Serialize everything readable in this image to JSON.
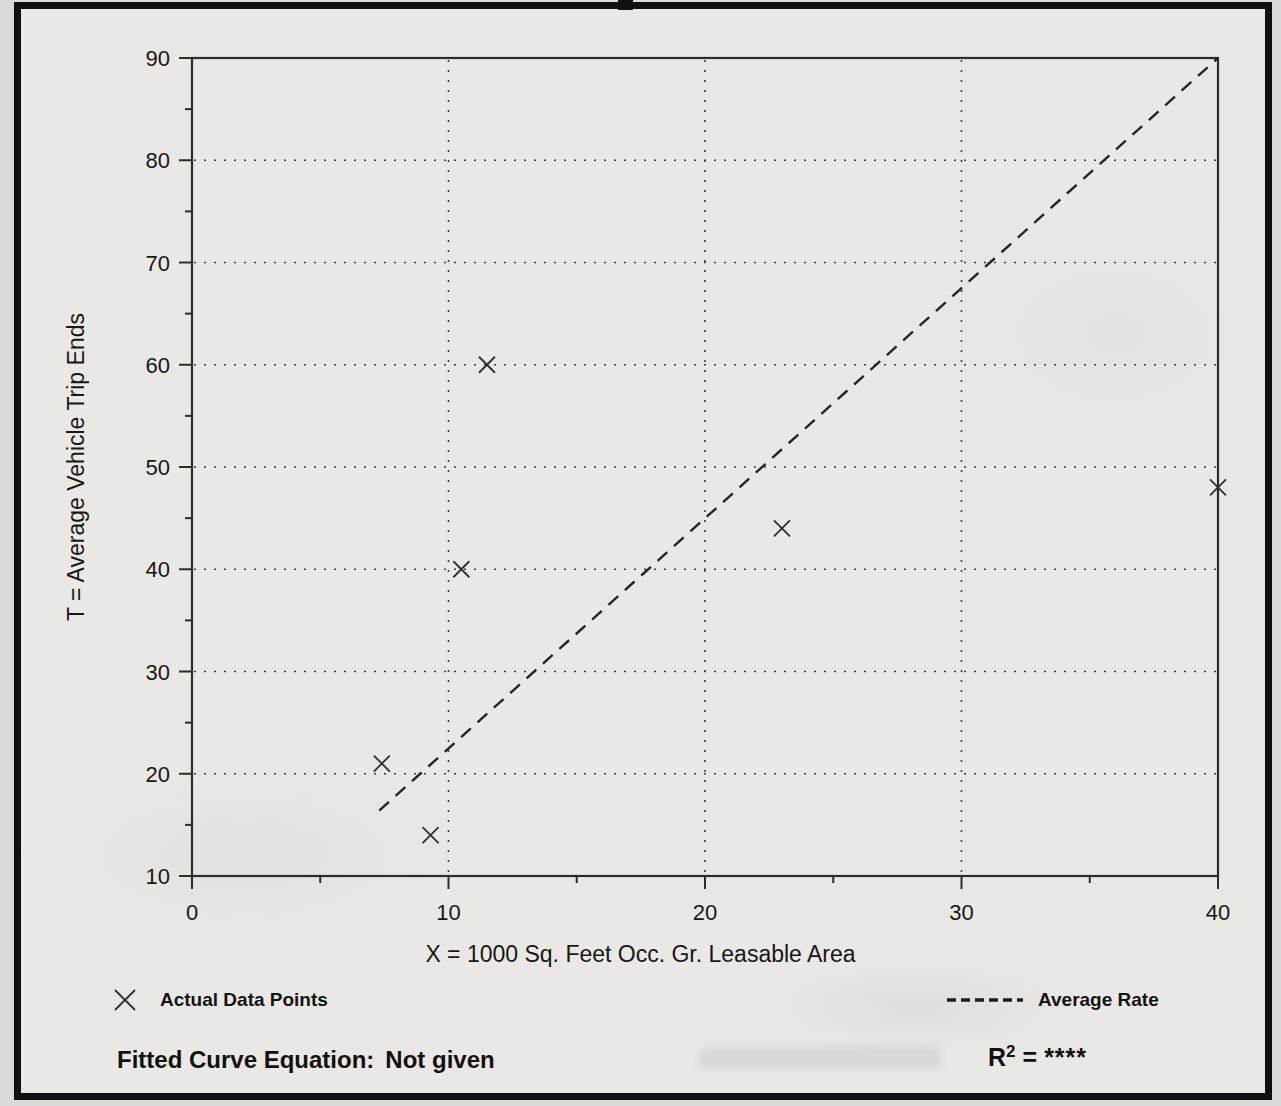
{
  "figure": {
    "ink_color": "#1a1a1a",
    "paper_color": "#eae8e4",
    "frame_color": "#101010"
  },
  "chart_data": {
    "type": "scatter",
    "title": "",
    "xlabel": "X = 1000 Sq. Feet Occ. Gr. Leasable Area",
    "ylabel": "T = Average Vehicle Trip Ends",
    "xlim": [
      0,
      40
    ],
    "ylim": [
      10,
      90
    ],
    "xticks": [
      0,
      10,
      20,
      30,
      40
    ],
    "yticks": [
      10,
      20,
      30,
      40,
      50,
      60,
      70,
      80,
      90
    ],
    "x_minor_ticks": [
      5,
      15,
      25,
      35
    ],
    "y_minor_ticks": [
      15,
      25,
      35,
      45,
      55,
      65,
      75,
      85
    ],
    "x_gridlines": [
      10,
      20,
      30
    ],
    "y_gridlines": [
      20,
      30,
      40,
      50,
      60,
      70,
      80
    ],
    "grid_style": "dotted",
    "marker": "x",
    "points": [
      [
        7.4,
        21
      ],
      [
        9.3,
        14
      ],
      [
        10.5,
        40
      ],
      [
        11.5,
        60
      ],
      [
        23,
        44
      ],
      [
        40,
        48
      ]
    ],
    "average_rate_line": {
      "x1": 7.3,
      "y1": 16.4,
      "x2": 40,
      "y2": 90
    },
    "legend_position": "bottom"
  },
  "legend": {
    "actual_points_label": "Actual Data Points",
    "average_rate_label": "Average Rate"
  },
  "footer": {
    "equation_label": "Fitted Curve Equation:",
    "equation_value": "Not given",
    "r2_base": "R",
    "r2_exponent": "2",
    "r2_equals": "=",
    "r2_value": "****"
  }
}
